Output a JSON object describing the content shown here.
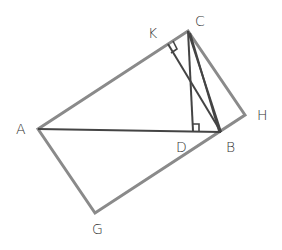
{
  "diagram": {
    "colors": {
      "rectangle_stroke": "#8a8a8a",
      "line_stroke": "#444444",
      "label": "#333333",
      "background": "#ffffff"
    },
    "points": {
      "A": {
        "x": 38,
        "y": 129
      },
      "B": {
        "x": 221,
        "y": 132
      },
      "C": {
        "x": 188,
        "y": 31
      },
      "D": {
        "x": 193,
        "y": 131
      },
      "K": {
        "x": 168,
        "y": 44
      },
      "H": {
        "x": 245,
        "y": 115
      },
      "G": {
        "x": 95,
        "y": 213
      }
    },
    "labels": [
      {
        "id": "A",
        "text": "A",
        "x": 16,
        "y": 134
      },
      {
        "id": "B",
        "text": "B",
        "x": 226,
        "y": 152
      },
      {
        "id": "C",
        "text": "C",
        "x": 195,
        "y": 26
      },
      {
        "id": "D",
        "text": "D",
        "x": 176,
        "y": 152
      },
      {
        "id": "K",
        "text": "K",
        "x": 148,
        "y": 38
      },
      {
        "id": "H",
        "text": "H",
        "x": 257,
        "y": 120
      },
      {
        "id": "G",
        "text": "G",
        "x": 92,
        "y": 234
      }
    ],
    "segments": [
      {
        "id": "AC",
        "from": "A",
        "to": "C",
        "style": "rect"
      },
      {
        "id": "CH",
        "from": "C",
        "to": "H",
        "style": "rect"
      },
      {
        "id": "HG",
        "from": "H",
        "to": "G",
        "style": "rect"
      },
      {
        "id": "GA",
        "from": "G",
        "to": "A",
        "style": "rect"
      },
      {
        "id": "AB",
        "from": "A",
        "to": "B",
        "style": "line"
      },
      {
        "id": "CB",
        "from": "C",
        "to": "B",
        "style": "line"
      },
      {
        "id": "CD",
        "from": "C",
        "to": "D",
        "style": "line"
      },
      {
        "id": "KB",
        "from": "K",
        "to": "B",
        "style": "line"
      }
    ],
    "right_angle_marks": [
      {
        "at": "K",
        "description": "right angle at K between AC and KB"
      },
      {
        "at": "D",
        "description": "right angle at D between AB and CD"
      }
    ]
  }
}
